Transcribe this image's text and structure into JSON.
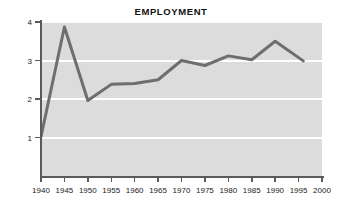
{
  "chart_data": {
    "type": "line",
    "title": "EMPLOYMENT",
    "xlabel": "",
    "ylabel": "Total civilian employment (in millions)",
    "x": [
      1940,
      1945,
      1950,
      1955,
      1960,
      1965,
      1970,
      1975,
      1980,
      1985,
      1990,
      1996
    ],
    "values": [
      1.02,
      3.87,
      1.96,
      2.38,
      2.4,
      2.5,
      3.0,
      2.87,
      3.12,
      3.02,
      3.5,
      2.99
    ],
    "series": [
      {
        "name": "Total civilian employment",
        "values": [
          1.02,
          3.87,
          1.96,
          2.38,
          2.4,
          2.5,
          3.0,
          2.87,
          3.12,
          3.02,
          3.5,
          2.99
        ]
      }
    ],
    "xlim": [
      1940,
      2000
    ],
    "ylim": [
      0,
      4
    ],
    "xticks": [
      1940,
      1945,
      1950,
      1955,
      1960,
      1965,
      1970,
      1975,
      1980,
      1985,
      1990,
      1995,
      2000
    ],
    "xtick_labels": [
      "1940",
      "1945",
      "1950",
      "1955",
      "1960",
      "1965",
      "1970",
      "1975",
      "1980",
      "1985",
      "1990",
      "1995",
      "2000"
    ],
    "yticks": [
      1,
      2,
      3,
      4
    ],
    "ytick_labels": [
      "1",
      "2",
      "3",
      "4"
    ],
    "gridlines": [
      1,
      2,
      3,
      4
    ],
    "grid": true,
    "legend": false,
    "colors": {
      "line": "#6e6e6e",
      "plot_background": "#dcdcdc",
      "gridline": "#ffffff",
      "axis": "#5a5a5a",
      "figure_background": "#ffffff",
      "text": "#222222"
    }
  }
}
